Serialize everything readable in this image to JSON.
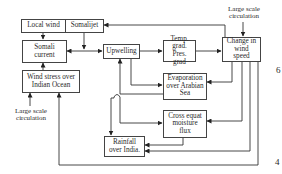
{
  "diagram": {
    "nodes": {
      "local_wind": "Local wind",
      "somalijet": "Somalijet",
      "somali_current": "Somali current",
      "wind_stress": "Wind stress over Indian Ocean",
      "upwelling": "Upwelling",
      "temp_pres_grad": "Temp. grad. Pres. grad",
      "change_wind_speed": "Change in wind speed",
      "evaporation": "Evaporation over Arabian Sea",
      "cross_equat": "Cross equat moisture flux",
      "rainfall": "Rainfall over India."
    },
    "labels": {
      "large_scale_top": "Large scale circulation",
      "large_scale_left": "Large scale circulation"
    },
    "page_numbers": {
      "six": "6",
      "four": "4"
    },
    "edges": [
      [
        "local_wind",
        "somali_current"
      ],
      [
        "somalijet",
        "somali_current"
      ],
      [
        "somalijet",
        "upwelling"
      ],
      [
        "somali_current",
        "upwelling"
      ],
      [
        "change_wind_speed",
        "somalijet"
      ],
      [
        "wind_stress",
        "somali_current"
      ],
      [
        "large_scale_left",
        "wind_stress"
      ],
      [
        "upwelling",
        "temp_pres_grad"
      ],
      [
        "temp_pres_grad",
        "change_wind_speed"
      ],
      [
        "large_scale_top",
        "change_wind_speed"
      ],
      [
        "upwelling",
        "evaporation"
      ],
      [
        "change_wind_speed",
        "evaporation"
      ],
      [
        "evaporation",
        "upwelling"
      ],
      [
        "upwelling",
        "rainfall"
      ],
      [
        "upwelling",
        "cross_equat"
      ],
      [
        "change_wind_speed",
        "cross_equat"
      ],
      [
        "cross_equat",
        "rainfall"
      ],
      [
        "change_wind_speed",
        "rainfall"
      ],
      [
        "change_wind_speed",
        "wind_stress"
      ]
    ]
  }
}
